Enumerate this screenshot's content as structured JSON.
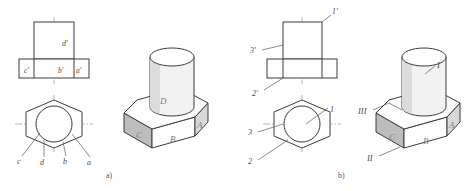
{
  "figure": {
    "captions": {
      "left": "a)",
      "right": "b)"
    },
    "colors": {
      "line": "#3c3c3c",
      "center_line": "#9a9a9a",
      "leader": "#5a5a5a",
      "shaded_face": "#bdbdbd",
      "mid_face": "#d8d8d8",
      "label_text": "#4a4a4a",
      "face_text": "#7d7d7d",
      "background": "#ffffff"
    }
  },
  "part_a": {
    "caption": "a)",
    "front_view": {
      "name": "front-view-a",
      "labels": [
        {
          "id": "d-prime",
          "text": "d′",
          "x": 62,
          "y": 46
        },
        {
          "id": "c-prime",
          "text": "c′",
          "x": 33,
          "y": 72
        },
        {
          "id": "b-prime",
          "text": "b′",
          "x": 63,
          "y": 72
        },
        {
          "id": "a-prime",
          "text": "a′",
          "x": 78,
          "y": 72
        }
      ]
    },
    "bottom_view": {
      "name": "bottom-view-a",
      "labels": [
        {
          "id": "c",
          "text": "c",
          "x": 19,
          "y": 160
        },
        {
          "id": "d",
          "text": "d",
          "x": 42,
          "y": 161
        },
        {
          "id": "b",
          "text": "b",
          "x": 65,
          "y": 160
        },
        {
          "id": "a",
          "text": "a",
          "x": 89,
          "y": 161
        }
      ]
    },
    "isometric": {
      "name": "isometric-view-a",
      "face_labels": [
        {
          "id": "D",
          "text": "D",
          "x": 163,
          "y": 101
        },
        {
          "id": "C",
          "text": "C",
          "x": 140,
          "y": 135
        },
        {
          "id": "B",
          "text": "B",
          "x": 174,
          "y": 140
        },
        {
          "id": "A",
          "text": "A",
          "x": 201,
          "y": 126
        }
      ]
    }
  },
  "part_b": {
    "caption": "b)",
    "front_view": {
      "name": "front-view-b",
      "labels": [
        {
          "id": "1-prime",
          "text": "1′",
          "x": 330,
          "y": 20
        },
        {
          "id": "3-prime",
          "text": "3′",
          "x": 252,
          "y": 51
        },
        {
          "id": "2-prime",
          "text": "2′",
          "x": 254,
          "y": 93
        }
      ]
    },
    "bottom_view": {
      "name": "bottom-view-b",
      "labels": [
        {
          "id": "1",
          "text": "1",
          "x": 331,
          "y": 110
        },
        {
          "id": "3",
          "text": "3",
          "x": 250,
          "y": 135
        },
        {
          "id": "2",
          "text": "2",
          "x": 251,
          "y": 162
        }
      ]
    },
    "isometric": {
      "name": "isometric-view-b",
      "roman_labels": [
        {
          "id": "I",
          "text": "I",
          "x": 438,
          "y": 68
        },
        {
          "id": "III",
          "text": "III",
          "x": 362,
          "y": 112
        },
        {
          "id": "II",
          "text": "II",
          "x": 370,
          "y": 159
        }
      ],
      "face_labels": [
        {
          "id": "C",
          "text": "C",
          "x": 397,
          "y": 139
        },
        {
          "id": "B",
          "text": "B",
          "x": 427,
          "y": 143
        },
        {
          "id": "A",
          "text": "A",
          "x": 452,
          "y": 128
        }
      ]
    }
  }
}
